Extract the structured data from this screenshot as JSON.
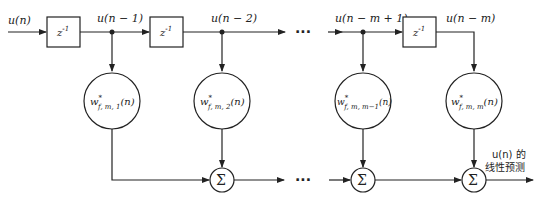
{
  "diagram": {
    "type": "lattice/transversal linear predictor block diagram",
    "input_label": "u(n)",
    "delay_label": "z",
    "delay_exp": "-1",
    "tap_labels": [
      "u(n − 1)",
      "u(n − 2)",
      "u(n − m + 1)",
      "u(n − m)"
    ],
    "weights": [
      {
        "base": "w",
        "sup": "*",
        "sub": "f, m, 1",
        "arg": "(n)"
      },
      {
        "base": "w",
        "sup": "*",
        "sub": "f, m, 2",
        "arg": "(n)"
      },
      {
        "base": "w",
        "sup": "*",
        "sub": "f, m, m−1",
        "arg": "(n)"
      },
      {
        "base": "w",
        "sup": "*",
        "sub": "f, m, m",
        "arg": "(n)"
      }
    ],
    "sum_symbol": "Σ",
    "ellipsis": "···",
    "output_label_line1": "u(n) 的",
    "output_label_line2": "线性预测"
  }
}
